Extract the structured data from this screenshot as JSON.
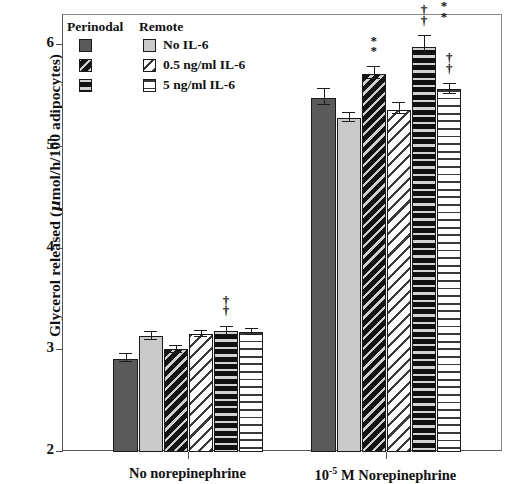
{
  "chart_data": {
    "type": "bar",
    "title": "",
    "xlabel": "",
    "ylabel": "Glycerol released (µmol/h/100 adipocytes)",
    "ylabel_parts": {
      "pre": "Glycerol released (",
      "mu": "µ",
      "post": "mol/h/100 adipocytes)"
    },
    "ylim": [
      2,
      6.3
    ],
    "yticks": [
      2,
      3,
      4,
      5,
      6
    ],
    "ytick_labels": [
      "2",
      "3",
      "4",
      "5",
      "6"
    ],
    "grid": false,
    "legend_position": "top-left-inside",
    "categories": [
      "No norepinephrine",
      "10-5 M Norepinephrine"
    ],
    "category_labels": [
      {
        "text": "No norepinephrine",
        "base": "No norepinephrine",
        "sup": ""
      },
      {
        "text": "10-5 M Norepinephrine",
        "base": "10",
        "sup": "-5",
        "tail": " M Norepinephrine"
      }
    ],
    "series": [
      {
        "name": "Perinodal, No IL-6",
        "group": "Perinodal",
        "treatment": "No IL-6",
        "fill": "solid-dark",
        "values": [
          2.92,
          5.48
        ],
        "errors": [
          0.05,
          0.1
        ]
      },
      {
        "name": "Remote, No IL-6",
        "group": "Remote",
        "treatment": "No IL-6",
        "fill": "solid-light",
        "values": [
          3.14,
          5.29
        ],
        "errors": [
          0.05,
          0.06
        ]
      },
      {
        "name": "Perinodal, 0.5 ng/ml IL-6",
        "group": "Perinodal",
        "treatment": "0.5 ng/ml IL-6",
        "fill": "diag-dark",
        "values": [
          3.01,
          5.72
        ],
        "errors": [
          0.04,
          0.08
        ]
      },
      {
        "name": "Remote, 0.5 ng/ml IL-6",
        "group": "Remote",
        "treatment": "0.5 ng/ml IL-6",
        "fill": "diag-light",
        "values": [
          3.16,
          5.37
        ],
        "errors": [
          0.04,
          0.07
        ]
      },
      {
        "name": "Perinodal, 5 ng/ml IL-6",
        "group": "Perinodal",
        "treatment": "5 ng/ml IL-6",
        "fill": "horz-dark",
        "values": [
          3.19,
          5.99
        ],
        "errors": [
          0.05,
          0.11
        ]
      },
      {
        "name": "Remote, 5 ng/ml IL-6",
        "group": "Remote",
        "treatment": "5 ng/ml IL-6",
        "fill": "horz-light",
        "values": [
          3.18,
          5.57
        ],
        "errors": [
          0.04,
          0.06
        ]
      }
    ],
    "annotations": [
      {
        "category": 0,
        "series": 4,
        "symbols": "†\n†",
        "text": "††"
      },
      {
        "category": 1,
        "series": 2,
        "symbols": "*\n*",
        "text": "**"
      },
      {
        "category": 1,
        "series": 4,
        "symbols": "†\n†",
        "text": "††"
      },
      {
        "category": 1,
        "series": 4,
        "symbols": "*\n*",
        "text": "**"
      },
      {
        "category": 1,
        "series": 5,
        "symbols": "†\n†",
        "text": "††"
      }
    ]
  },
  "legend": {
    "header_left": "Perinodal",
    "header_right": "Remote",
    "rows": [
      {
        "label": "No IL-6"
      },
      {
        "label": "0.5 ng/ml IL-6"
      },
      {
        "label": "5 ng/ml IL-6"
      }
    ]
  },
  "colors": {
    "bar_dark_solid": "#5a5a5a",
    "bar_light_solid": "#c9c9c9",
    "ink": "#111111",
    "axis": "#555555",
    "background": "#ffffff"
  }
}
